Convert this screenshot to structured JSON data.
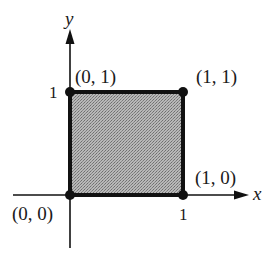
{
  "diagram": {
    "type": "unit-square",
    "axes": {
      "x_label": "x",
      "y_label": "y"
    },
    "ticks": {
      "x_tick": "1",
      "y_tick": "1"
    },
    "points": [
      {
        "id": "origin",
        "label": "(0, 0)",
        "x": 0,
        "y": 0
      },
      {
        "id": "x-unit",
        "label": "(1, 0)",
        "x": 1,
        "y": 0
      },
      {
        "id": "y-unit",
        "label": "(0, 1)",
        "x": 0,
        "y": 1
      },
      {
        "id": "corner",
        "label": "(1, 1)",
        "x": 1,
        "y": 1
      }
    ],
    "colors": {
      "fill": "#a9a9a9",
      "stroke": "#111111",
      "background": "#ffffff"
    }
  }
}
